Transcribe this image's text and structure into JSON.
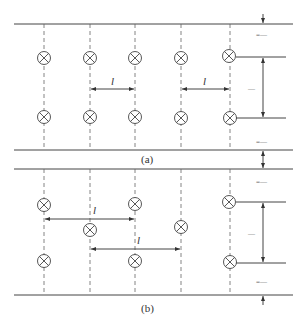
{
  "figure": {
    "colors": {
      "line": "#444444",
      "dashed": "#666666",
      "background": "#ffffff"
    }
  },
  "panel_a": {
    "caption": "(a)",
    "arrangement": "rectangular (aligned rows)",
    "spacing_label": "l",
    "row_spacing_label": "—",
    "wall_clearance_top_label": "=—",
    "wall_clearance_bottom_label": "=—",
    "columns_x": [
      44,
      90,
      135,
      181,
      230
    ],
    "lamps": [
      {
        "x": 44,
        "y": 58
      },
      {
        "x": 90,
        "y": 58
      },
      {
        "x": 135,
        "y": 58
      },
      {
        "x": 181,
        "y": 58
      },
      {
        "x": 229,
        "y": 56
      },
      {
        "x": 44,
        "y": 117
      },
      {
        "x": 90,
        "y": 117
      },
      {
        "x": 135,
        "y": 117
      },
      {
        "x": 181,
        "y": 118
      },
      {
        "x": 230,
        "y": 118
      }
    ]
  },
  "panel_b": {
    "caption": "(b)",
    "arrangement": "staggered (diamond)",
    "spacing_label": "l",
    "row_spacing_label": "—",
    "wall_clearance_top_label": "=—",
    "wall_clearance_bottom_label": "=—",
    "columns_x": [
      44,
      90,
      135,
      181,
      230
    ],
    "lamps": [
      {
        "x": 44,
        "y": 205
      },
      {
        "x": 135,
        "y": 204
      },
      {
        "x": 229,
        "y": 202
      },
      {
        "x": 90,
        "y": 230
      },
      {
        "x": 181,
        "y": 227
      },
      {
        "x": 44,
        "y": 261
      },
      {
        "x": 135,
        "y": 261
      },
      {
        "x": 230,
        "y": 262
      }
    ]
  },
  "legend": {
    "lamp_symbol": "lamp-icon (circle with X)"
  }
}
